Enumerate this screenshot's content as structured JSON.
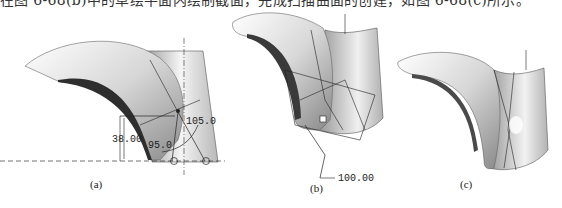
{
  "page": {
    "top_text_clipped": "在图 6-68(b)中的草绘平面内绘制截面，完成扫描曲面的创建，如图 6-68(c)所示。"
  },
  "figures": [
    {
      "id": "a",
      "caption": "(a)",
      "dimensions": [
        {
          "label": "38.00",
          "type": "linear"
        },
        {
          "label": "95.0",
          "type": "angular"
        },
        {
          "label": "105.0",
          "type": "angular"
        }
      ]
    },
    {
      "id": "b",
      "caption": "(b)",
      "dimensions": [
        {
          "label": "100.00",
          "type": "linear"
        }
      ]
    },
    {
      "id": "c",
      "caption": "(c)",
      "dimensions": []
    }
  ],
  "colors": {
    "surface_light": "#f2f2f2",
    "surface_mid": "#bdbdbd",
    "surface_dark": "#3a3a3a",
    "line": "#222222"
  }
}
